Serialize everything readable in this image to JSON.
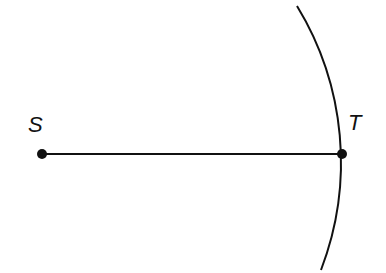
{
  "diagram": {
    "points": [
      {
        "label": "S",
        "x": 42,
        "y": 154
      },
      {
        "label": "T",
        "x": 342,
        "y": 154
      }
    ],
    "segment": {
      "from": "S",
      "to": "T"
    },
    "arc": {
      "center": "S",
      "radius": 300,
      "passes_through": "T"
    },
    "colors": {
      "stroke": "#111111",
      "background": "#ffffff"
    }
  }
}
